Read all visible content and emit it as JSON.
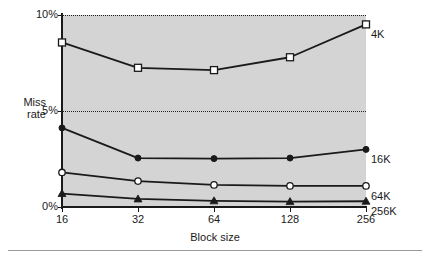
{
  "chart_data": {
    "type": "line",
    "title": "",
    "xlabel": "Block size",
    "ylabel": "Miss rate",
    "ylabel_lines": [
      "Miss",
      "rate"
    ],
    "categories": [
      "16",
      "32",
      "64",
      "128",
      "256"
    ],
    "xtick_labels": [
      "16",
      "32",
      "64",
      "128",
      "256"
    ],
    "ytick_labels": [
      "0%",
      "5%",
      "10%"
    ],
    "ytick_values": [
      0,
      5,
      10
    ],
    "ylim": [
      0,
      10
    ],
    "grid": "horizontal-dotted",
    "legend_position": "right-of-plot-end-labels",
    "plot_background": "#d4d4d4",
    "series": [
      {
        "name": "4K",
        "label": "4K",
        "marker": "open-square",
        "color": "#1a1a1a",
        "values": [
          8.57,
          7.25,
          7.13,
          7.8,
          9.51
        ]
      },
      {
        "name": "16K",
        "label": "16K",
        "marker": "filled-circle",
        "color": "#1a1a1a",
        "values": [
          4.12,
          2.55,
          2.52,
          2.55,
          3.0
        ]
      },
      {
        "name": "64K",
        "label": "64K",
        "marker": "open-circle",
        "color": "#1a1a1a",
        "values": [
          1.8,
          1.35,
          1.15,
          1.1,
          1.1
        ]
      },
      {
        "name": "256K",
        "label": "256K",
        "marker": "filled-triangle",
        "color": "#1a1a1a",
        "values": [
          0.7,
          0.42,
          0.32,
          0.28,
          0.3
        ]
      }
    ]
  },
  "figure": {
    "bottom_rule_color": "#9a9a9a"
  }
}
